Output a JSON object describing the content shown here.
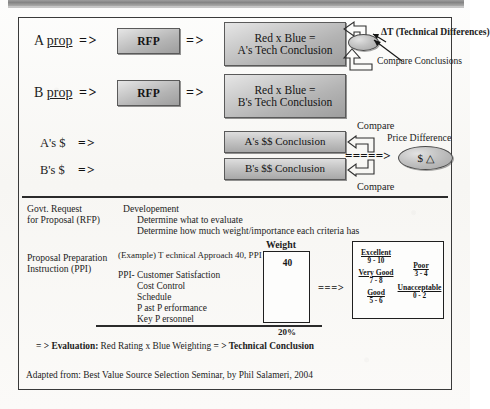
{
  "document": {
    "title": "Best Value Source Selection Evaluation Process",
    "attribution": "Adapted from: Best Value Source Selection Seminar, by Phil Salameri, 2004"
  },
  "flow": {
    "rows": [
      {
        "input_label_a": "A",
        "input_label_b": "prop",
        "arrow1": "= >",
        "rfp": "RFP",
        "arrow2": "= >",
        "conclusion_line1": "Red x Blue =",
        "conclusion_line2": "A's Tech Conclusion"
      },
      {
        "input_label_a": "B",
        "input_label_b": "prop",
        "arrow1": "= >",
        "rfp": "RFP",
        "arrow2": "= >",
        "conclusion_line1": "Red x Blue =",
        "conclusion_line2": "B's Tech Conclusion"
      }
    ],
    "money_rows": [
      {
        "label": "A's $",
        "arrow": "= >",
        "conclusion": "A's $$ Conclusion"
      },
      {
        "label": "B's $",
        "arrow": "= >",
        "conclusion": "B's $$ Conclusion"
      }
    ],
    "annotations": {
      "tech_difference": "ΔT (Technical Differences)",
      "compare_conclusions": "Compare Conclusions",
      "compare_top": "Compare",
      "compare_bottom": "Compare",
      "price_difference_label": "Price Difference",
      "price_difference_symbol": "$ △",
      "dashed_arrow": "= = = = = >"
    }
  },
  "table": {
    "rows": [
      {
        "left_line1": "Govt. Request",
        "left_line2": "for Proposal (RFP)",
        "right_lines": [
          "Developement",
          "Determine what to evaluate",
          "Determine how much weight/importance each criteria has"
        ]
      },
      {
        "left_line1": "Proposal Preparation",
        "left_line2": "Instruction (PPI)",
        "example_line": "(Example) T echnical Approach 40, PPI 40:",
        "ppi_lines": [
          "PPI- Customer Satisfaction",
          "Cost Control",
          "Schedule",
          "P  ast P  erformance",
          "Key P  ersonnel"
        ]
      }
    ],
    "weight": {
      "header": "Weight",
      "value": "40",
      "percent": "20%"
    },
    "arrow": "= = = >",
    "rating_scale": {
      "entries": [
        {
          "label": "Excellent",
          "range": "9 - 10"
        },
        {
          "label": "Very Good",
          "range": "7 - 8"
        },
        {
          "label": "Good",
          "range": "5 - 6"
        },
        {
          "label": "Poor",
          "range": "3 - 4"
        },
        {
          "label": "Unacceptable",
          "range": "0 - 2"
        }
      ]
    }
  },
  "evaluation": {
    "prefix": "= > ",
    "bold_label": "Evaluation:",
    "middle": " Red Rating x Blue Weighting ",
    "arrow": "= > ",
    "bold_tail": "Technical Conclusion"
  },
  "colors": {
    "ink": "#1d1d1d",
    "box_border": "#5a5a5a",
    "box_fill_light": "#e6e6e6",
    "box_fill_dark": "#9e9e9e",
    "frame": "#3a3a3a",
    "paper": "#fbfaf8"
  }
}
